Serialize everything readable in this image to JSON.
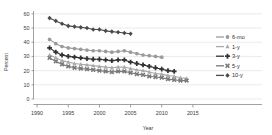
{
  "chart_data": {
    "type": "line",
    "title": "",
    "xlabel": "Year",
    "ylabel": "Percent",
    "xlim": [
      1989.5,
      2015.5
    ],
    "ylim": [
      0,
      62
    ],
    "xticks": [
      1990,
      1995,
      2000,
      2005,
      2010,
      2015
    ],
    "yticks": [
      0,
      10,
      20,
      30,
      40,
      50,
      60
    ],
    "grid": "horizontal",
    "legend_position": "right",
    "legend_entries": [
      {
        "name": "6-mo",
        "marker": "circle",
        "color": "#9b9b9b"
      },
      {
        "name": "1-y",
        "marker": "triangle",
        "color": "#a9a9a9"
      },
      {
        "name": "3-y",
        "marker": "plus",
        "color": "#333333"
      },
      {
        "name": "5-y",
        "marker": "x",
        "color": "#7a7a7a"
      },
      {
        "name": "10-y",
        "marker": "diamond",
        "color": "#4a4a4a"
      }
    ],
    "series": [
      {
        "name": "10-y",
        "marker": "diamond",
        "color": "#4a4a4a",
        "x": [
          1992,
          1993,
          1994,
          1995,
          1996,
          1997,
          1998,
          1999,
          2000,
          2001,
          2002,
          2003,
          2004,
          2005
        ],
        "values": [
          57.0,
          55.0,
          53.0,
          51.5,
          51.0,
          50.5,
          50.0,
          49.0,
          49.0,
          48.0,
          47.5,
          47.0,
          46.5,
          46.0
        ]
      },
      {
        "name": "6-mo",
        "marker": "circle",
        "color": "#9b9b9b",
        "x": [
          1992,
          1993,
          1994,
          1995,
          1996,
          1997,
          1998,
          1999,
          2000,
          2001,
          2002,
          2003,
          2004,
          2005,
          2006,
          2007,
          2008,
          2009,
          2010
        ],
        "values": [
          42.0,
          39.0,
          37.0,
          36.0,
          35.5,
          35.0,
          34.5,
          34.0,
          34.0,
          33.5,
          33.0,
          33.5,
          34.0,
          33.0,
          32.0,
          31.0,
          30.5,
          30.0,
          29.5
        ]
      },
      {
        "name": "3-y",
        "marker": "plus",
        "color": "#333333",
        "x": [
          1992,
          1993,
          1994,
          1995,
          1996,
          1997,
          1998,
          1999,
          2000,
          2001,
          2002,
          2003,
          2004,
          2005,
          2006,
          2007,
          2008,
          2009,
          2010,
          2011,
          2012
        ],
        "values": [
          36.0,
          33.0,
          31.0,
          30.0,
          29.5,
          29.0,
          28.5,
          28.0,
          28.0,
          27.5,
          27.0,
          27.5,
          27.5,
          26.0,
          25.0,
          24.0,
          23.0,
          22.0,
          21.0,
          20.0,
          19.5
        ]
      },
      {
        "name": "1-y",
        "marker": "triangle",
        "color": "#a9a9a9",
        "x": [
          1992,
          1993,
          1994,
          1995,
          1996,
          1997,
          1998,
          1999,
          2000,
          2001,
          2002,
          2003,
          2004,
          2005,
          2006,
          2007,
          2008,
          2009,
          2010,
          2011,
          2012,
          2013,
          2014
        ],
        "values": [
          31.0,
          29.0,
          27.0,
          26.0,
          25.0,
          24.5,
          24.0,
          23.5,
          23.0,
          22.5,
          22.0,
          22.5,
          22.5,
          21.5,
          20.5,
          20.0,
          19.0,
          18.0,
          17.5,
          16.5,
          16.0,
          15.0,
          14.5
        ]
      },
      {
        "name": "5-y",
        "marker": "x",
        "color": "#7a7a7a",
        "x": [
          1992,
          1993,
          1994,
          1995,
          1996,
          1997,
          1998,
          1999,
          2000,
          2001,
          2002,
          2003,
          2004,
          2005,
          2006,
          2007,
          2008,
          2009,
          2010,
          2011,
          2012,
          2013,
          2014
        ],
        "values": [
          29.0,
          26.5,
          24.5,
          23.0,
          22.0,
          21.5,
          21.0,
          20.5,
          20.0,
          19.5,
          19.0,
          19.5,
          19.5,
          18.5,
          17.5,
          17.0,
          16.0,
          15.5,
          15.0,
          14.0,
          13.5,
          13.0,
          13.0
        ]
      }
    ]
  },
  "labels": {
    "ylabel": "Percent",
    "xlabel": "Year"
  }
}
